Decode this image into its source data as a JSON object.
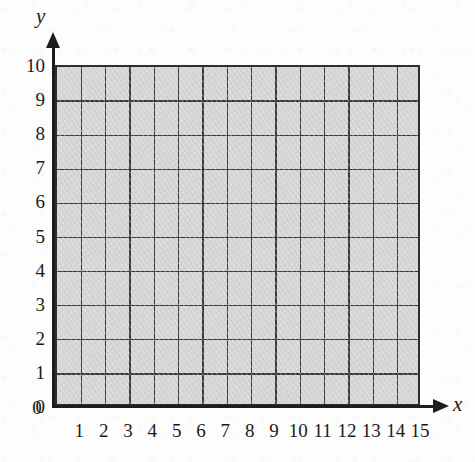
{
  "figure": {
    "type": "blank-coordinate-grid",
    "axis_labels": {
      "x": "x",
      "y": "y"
    }
  },
  "chart_data": {
    "type": "scatter",
    "title": "",
    "subtitle": "",
    "xlabel": "x",
    "ylabel": "y",
    "xlim": [
      0,
      15
    ],
    "ylim": [
      0,
      10
    ],
    "xticks": [
      0,
      1,
      2,
      3,
      4,
      5,
      6,
      7,
      8,
      9,
      10,
      11,
      12,
      13,
      14,
      15
    ],
    "yticks": [
      0,
      1,
      2,
      3,
      4,
      5,
      6,
      7,
      8,
      9,
      10
    ],
    "xtick_labels": [
      "0",
      "1",
      "2",
      "3",
      "4",
      "5",
      "6",
      "7",
      "8",
      "9",
      "10",
      "11",
      "12",
      "13",
      "14",
      "15"
    ],
    "ytick_labels": [
      "0",
      "1",
      "2",
      "3",
      "4",
      "5",
      "6",
      "7",
      "8",
      "9",
      "10"
    ],
    "grid": true,
    "grid_spacing_x": 1,
    "grid_spacing_y": 1,
    "legend": null,
    "legend_position": "none",
    "series": [],
    "values": [],
    "annotations": [],
    "plot_area_fill": "#d5d5d5",
    "grid_line_color": "#3a3a3a",
    "axis_color": "#1d1d1d",
    "background_color": "#fdfdfd"
  }
}
